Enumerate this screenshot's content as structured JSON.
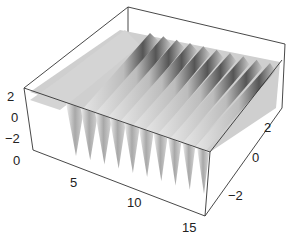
{
  "chart_data": {
    "type": "surface3d",
    "title": "",
    "xlabel": "",
    "ylabel": "",
    "zlabel": "",
    "x_ticks": [
      "5",
      "10",
      "15"
    ],
    "y_ticks": [
      "-2",
      "0",
      "2"
    ],
    "z_ticks": [
      "-2",
      "0",
      "2"
    ],
    "extra_label": "0",
    "xlim": [
      0,
      16
    ],
    "ylim": [
      -3,
      3
    ],
    "zlim": [
      -3,
      3
    ],
    "ridge_count": 10,
    "colors": {
      "box": "#333333",
      "surface_light": "#d8d8d8",
      "surface_dark": "#555555"
    }
  }
}
